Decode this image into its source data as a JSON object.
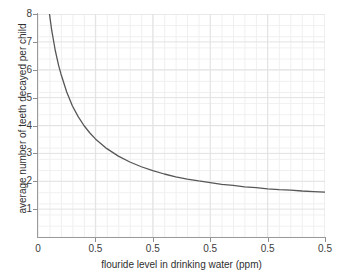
{
  "chart_data": {
    "type": "line",
    "title": "",
    "xlabel": "flouride level in drinking water (ppm)",
    "ylabel": "average number of teeth decayed per child",
    "xlim": [
      0,
      2.5
    ],
    "ylim": [
      0,
      8
    ],
    "grid": true,
    "minor_grid": true,
    "legend": "none",
    "x_tick_values": [
      0,
      0.5,
      1.0,
      1.5,
      2.0,
      2.5
    ],
    "x_tick_labels": [
      "0",
      "0.5",
      "0.5",
      "0.5",
      "0.5",
      "0.5"
    ],
    "y_tick_values": [
      1,
      2,
      3,
      4,
      5,
      6,
      7,
      8
    ],
    "y_tick_labels": [
      "1",
      "2",
      "3",
      "4",
      "5",
      "6",
      "7",
      "8"
    ],
    "series": [
      {
        "name": "average teeth decayed",
        "color": "#575757",
        "asymptote": 1.45,
        "x": [
          0.1,
          0.12,
          0.15,
          0.18,
          0.2,
          0.25,
          0.3,
          0.35,
          0.4,
          0.45,
          0.5,
          0.6,
          0.7,
          0.8,
          0.9,
          1.0,
          1.1,
          1.2,
          1.3,
          1.4,
          1.5,
          1.6,
          1.7,
          1.8,
          1.9,
          2.0,
          2.1,
          2.2,
          2.3,
          2.4,
          2.5
        ],
        "y": [
          8.0,
          7.4,
          6.7,
          6.15,
          5.85,
          5.2,
          4.7,
          4.32,
          4.0,
          3.74,
          3.52,
          3.17,
          2.9,
          2.69,
          2.52,
          2.38,
          2.26,
          2.16,
          2.08,
          2.01,
          1.95,
          1.89,
          1.85,
          1.8,
          1.77,
          1.73,
          1.7,
          1.68,
          1.65,
          1.63,
          1.61
        ]
      }
    ]
  },
  "axis": {
    "y_title": "average number of teeth decayed per child",
    "x_title": "flouride level in drinking water (ppm)",
    "origin_label": "0"
  },
  "colors": {
    "curve": "#575757",
    "axis": "#9a9a9a",
    "major_grid": "#e2e2e4",
    "minor_grid": "#f0eff0",
    "text": "#2f2f2f",
    "background": "#ffffff"
  }
}
